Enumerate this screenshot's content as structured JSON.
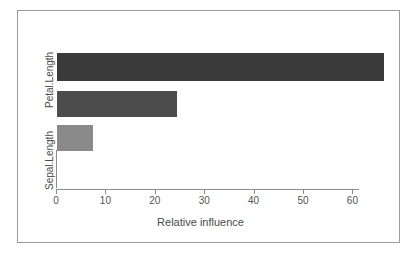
{
  "chart_data": {
    "type": "bar",
    "orientation": "horizontal",
    "title": "",
    "subtitle": "",
    "xlabel": "Relative influence",
    "ylabel": "",
    "categories": [
      "Sepal.Length",
      "Sepal.Width",
      "Petal.Length"
    ],
    "values": [
      7.7,
      24.7,
      66.6
    ],
    "series": [
      {
        "name": "Relative influence",
        "values": [
          7.7,
          24.7,
          66.6
        ]
      }
    ],
    "bars": [
      {
        "category": "Petal.Length",
        "value": 66.6,
        "color": "#3a3a3a",
        "row": 0,
        "label_shown": true
      },
      {
        "category": "Sepal.Width",
        "value": 24.7,
        "color": "#4c4c4c",
        "row": 1,
        "label_shown": false
      },
      {
        "category": "Sepal.Length",
        "value": 7.7,
        "color": "#8a8a8a",
        "row": 2,
        "label_shown": true
      }
    ],
    "xticks": [
      0,
      10,
      20,
      30,
      40,
      50,
      60
    ],
    "xticklabels": [
      "0",
      "10",
      "20",
      "30",
      "40",
      "50",
      "60"
    ],
    "yticklabels": [
      "Petal.Length",
      "Sepal.Length"
    ],
    "xlim": [
      0,
      67
    ],
    "grid": false,
    "legend": false,
    "legend_position": "none"
  },
  "axes": {
    "x_title": "Relative influence",
    "x_ticks": [
      "0",
      "10",
      "20",
      "30",
      "40",
      "50",
      "60"
    ],
    "y_labels": [
      "Petal.Length",
      "Sepal.Length"
    ]
  },
  "style": {
    "frame_color": "#9a9a9a",
    "axis_color": "#8c8c8c",
    "text_color": "#4a4a4a",
    "background": "#ffffff",
    "bar_colors": [
      "#3a3a3a",
      "#4c4c4c",
      "#8a8a8a"
    ]
  }
}
